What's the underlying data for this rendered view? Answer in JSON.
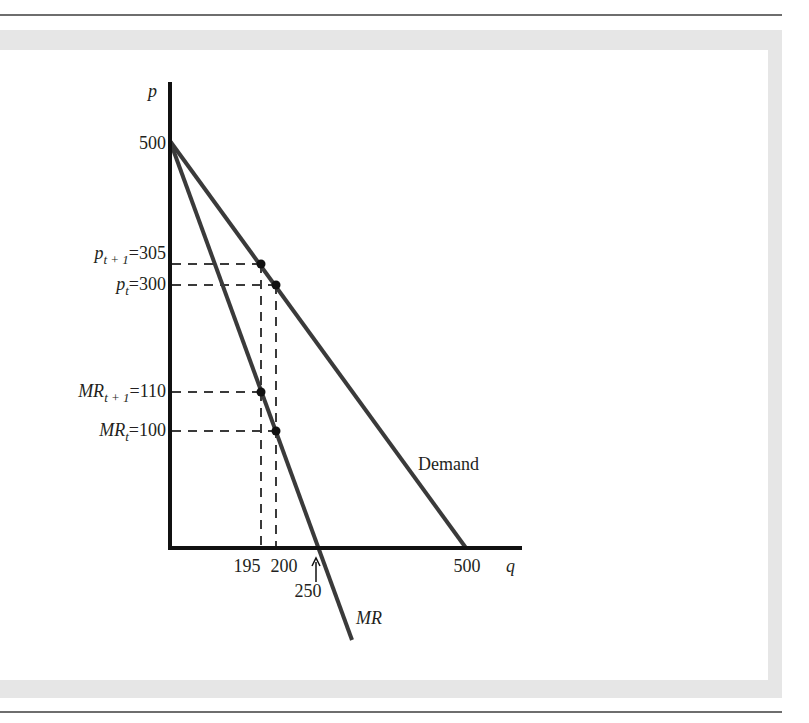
{
  "figure": {
    "axes": {
      "y_label": "p",
      "x_label": "q",
      "y_ticks": [
        {
          "label_main": "500",
          "value": 500
        },
        {
          "label_main": "p",
          "label_sub": "t + 1",
          "label_tail": "=305",
          "value": 305
        },
        {
          "label_main": "p",
          "label_sub": "t",
          "label_tail": "=300",
          "value": 300
        },
        {
          "label_main": "MR",
          "label_sub": "t + 1",
          "label_tail": "=110",
          "value": 110
        },
        {
          "label_main": "MR",
          "label_sub": "t",
          "label_tail": "=100",
          "value": 100
        }
      ],
      "x_ticks": [
        {
          "label": "195",
          "value": 195
        },
        {
          "label": "200",
          "value": 200
        },
        {
          "label": "250",
          "value": 250,
          "note": "arrow"
        },
        {
          "label": "500",
          "value": 500
        }
      ]
    },
    "curves": {
      "demand": {
        "label": "Demand",
        "from": [
          0,
          500
        ],
        "to": [
          500,
          0
        ]
      },
      "mr": {
        "label": "MR",
        "from": [
          0,
          500
        ],
        "x_intercept": 250
      }
    },
    "points": [
      {
        "name": "demand-t+1",
        "q": 195,
        "p": 305
      },
      {
        "name": "demand-t",
        "q": 200,
        "p": 300
      },
      {
        "name": "mr-t+1",
        "q": 195,
        "mr": 110
      },
      {
        "name": "mr-t",
        "q": 200,
        "mr": 100
      }
    ],
    "colors": {
      "line": "#3a3a3a",
      "axis": "#111111",
      "frame": "#e6e6e6",
      "rule": "#6e6e6e"
    }
  }
}
